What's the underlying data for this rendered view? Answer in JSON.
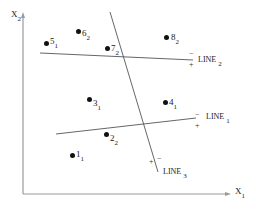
{
  "diagram": {
    "axes": {
      "x_label": {
        "main": "X",
        "sub": "1"
      },
      "y_label": {
        "main": "X",
        "sub": "2"
      }
    },
    "points": [
      {
        "id": "1",
        "class": "1",
        "x": 72,
        "y": 155
      },
      {
        "id": "2",
        "class": "2",
        "x": 106,
        "y": 134
      },
      {
        "id": "3",
        "class": "1",
        "x": 89,
        "y": 99
      },
      {
        "id": "4",
        "class": "1",
        "x": 165,
        "y": 102
      },
      {
        "id": "5",
        "class": "1",
        "x": 46,
        "y": 43
      },
      {
        "id": "6",
        "class": "2",
        "x": 78,
        "y": 31
      },
      {
        "id": "7",
        "class": "2",
        "x": 107,
        "y": 48
      },
      {
        "id": "8",
        "class": "2",
        "x": 166,
        "y": 37
      }
    ],
    "lines": [
      {
        "name": "LINE",
        "sub": "1",
        "minus": "−",
        "plus": "+"
      },
      {
        "name": "LINE",
        "sub": "2",
        "minus": "−",
        "plus": "+"
      },
      {
        "name": "LINE",
        "sub": "3",
        "minus": "−",
        "plus": "+"
      }
    ],
    "colors": {
      "axis": "#9a9a9a",
      "line": "#555555",
      "point": "#111111",
      "text": "#222222"
    }
  }
}
